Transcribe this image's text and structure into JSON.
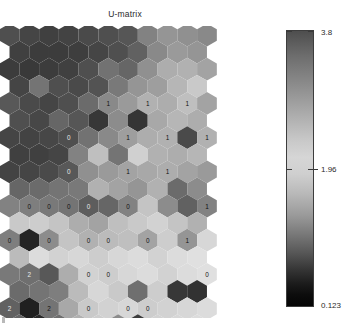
{
  "figure": {
    "title": "U-matrix",
    "background": "#ffffff"
  },
  "colorbar": {
    "name": "u-matrix-colorbar",
    "max_label": "3.8",
    "mid_label": "1.96",
    "min_label": "0.123",
    "max_value": 3.8,
    "mid_value": 1.96,
    "min_value": 0.123,
    "orientation": "vertical"
  },
  "chart_data": {
    "type": "heatmap",
    "subtype": "hexagonal-som-umatrix",
    "title": "U-matrix",
    "xlabel": "",
    "ylabel": "",
    "grid": false,
    "legend_position": "right",
    "colorbar": {
      "ticks": [
        0.123,
        1.96,
        3.8
      ],
      "tick_labels": [
        "0.123",
        "1.96",
        "3.8"
      ],
      "colormap": "gray-inverted",
      "vmin": 0.123,
      "vmax": 3.8
    },
    "layout": {
      "lattice": "hexagonal",
      "columns": 11,
      "rows": 17,
      "odd_row_offset": 0.5
    },
    "note": "Values are U-matrix distances mapped to gray levels; light = high separation, dark = low.",
    "cells": [
      {
        "row": 0,
        "col": 0,
        "v": 0.3,
        "label": ""
      },
      {
        "row": 0,
        "col": 1,
        "v": 0.26,
        "label": ""
      },
      {
        "row": 0,
        "col": 2,
        "v": 0.24,
        "label": ""
      },
      {
        "row": 0,
        "col": 3,
        "v": 0.25,
        "label": ""
      },
      {
        "row": 0,
        "col": 4,
        "v": 0.28,
        "label": ""
      },
      {
        "row": 0,
        "col": 5,
        "v": 0.3,
        "label": ""
      },
      {
        "row": 0,
        "col": 6,
        "v": 0.33,
        "label": ""
      },
      {
        "row": 0,
        "col": 7,
        "v": 0.52,
        "label": ""
      },
      {
        "row": 0,
        "col": 8,
        "v": 0.6,
        "label": ""
      },
      {
        "row": 0,
        "col": 9,
        "v": 0.58,
        "label": ""
      },
      {
        "row": 0,
        "col": 10,
        "v": 0.55,
        "label": ""
      },
      {
        "row": 1,
        "col": 0,
        "v": 0.24,
        "label": ""
      },
      {
        "row": 1,
        "col": 1,
        "v": 0.22,
        "label": ""
      },
      {
        "row": 1,
        "col": 2,
        "v": 0.22,
        "label": ""
      },
      {
        "row": 1,
        "col": 3,
        "v": 0.23,
        "label": ""
      },
      {
        "row": 1,
        "col": 4,
        "v": 0.26,
        "label": ""
      },
      {
        "row": 1,
        "col": 5,
        "v": 0.3,
        "label": ""
      },
      {
        "row": 1,
        "col": 6,
        "v": 0.38,
        "label": ""
      },
      {
        "row": 1,
        "col": 7,
        "v": 0.55,
        "label": ""
      },
      {
        "row": 1,
        "col": 8,
        "v": 0.62,
        "label": ""
      },
      {
        "row": 1,
        "col": 9,
        "v": 0.6,
        "label": ""
      },
      {
        "row": 2,
        "col": 0,
        "v": 0.22,
        "label": ""
      },
      {
        "row": 2,
        "col": 1,
        "v": 0.21,
        "label": ""
      },
      {
        "row": 2,
        "col": 2,
        "v": 0.22,
        "label": ""
      },
      {
        "row": 2,
        "col": 3,
        "v": 0.24,
        "label": ""
      },
      {
        "row": 2,
        "col": 4,
        "v": 0.3,
        "label": ""
      },
      {
        "row": 2,
        "col": 5,
        "v": 0.45,
        "label": ""
      },
      {
        "row": 2,
        "col": 6,
        "v": 0.4,
        "label": ""
      },
      {
        "row": 2,
        "col": 7,
        "v": 0.58,
        "label": ""
      },
      {
        "row": 2,
        "col": 8,
        "v": 0.7,
        "label": ""
      },
      {
        "row": 2,
        "col": 9,
        "v": 0.72,
        "label": ""
      },
      {
        "row": 2,
        "col": 10,
        "v": 0.66,
        "label": ""
      },
      {
        "row": 3,
        "col": 0,
        "v": 0.26,
        "label": ""
      },
      {
        "row": 3,
        "col": 1,
        "v": 0.46,
        "label": ""
      },
      {
        "row": 3,
        "col": 2,
        "v": 0.3,
        "label": ""
      },
      {
        "row": 3,
        "col": 3,
        "v": 0.28,
        "label": ""
      },
      {
        "row": 3,
        "col": 4,
        "v": 0.32,
        "label": ""
      },
      {
        "row": 3,
        "col": 5,
        "v": 0.48,
        "label": ""
      },
      {
        "row": 3,
        "col": 6,
        "v": 0.6,
        "label": ""
      },
      {
        "row": 3,
        "col": 7,
        "v": 0.64,
        "label": ""
      },
      {
        "row": 3,
        "col": 8,
        "v": 0.74,
        "label": ""
      },
      {
        "row": 3,
        "col": 9,
        "v": 0.82,
        "label": ""
      },
      {
        "row": 4,
        "col": 0,
        "v": 0.34,
        "label": ""
      },
      {
        "row": 4,
        "col": 1,
        "v": 0.28,
        "label": ""
      },
      {
        "row": 4,
        "col": 2,
        "v": 0.26,
        "label": ""
      },
      {
        "row": 4,
        "col": 3,
        "v": 0.3,
        "label": ""
      },
      {
        "row": 4,
        "col": 4,
        "v": 0.42,
        "label": ""
      },
      {
        "row": 4,
        "col": 5,
        "v": 0.55,
        "label": "1"
      },
      {
        "row": 4,
        "col": 6,
        "v": 0.62,
        "label": ""
      },
      {
        "row": 4,
        "col": 7,
        "v": 0.72,
        "label": "1"
      },
      {
        "row": 4,
        "col": 8,
        "v": 0.7,
        "label": ""
      },
      {
        "row": 4,
        "col": 9,
        "v": 0.78,
        "label": "1"
      },
      {
        "row": 4,
        "col": 10,
        "v": 0.66,
        "label": ""
      },
      {
        "row": 5,
        "col": 0,
        "v": 0.3,
        "label": ""
      },
      {
        "row": 5,
        "col": 1,
        "v": 0.27,
        "label": ""
      },
      {
        "row": 5,
        "col": 2,
        "v": 0.4,
        "label": ""
      },
      {
        "row": 5,
        "col": 3,
        "v": 0.33,
        "label": ""
      },
      {
        "row": 5,
        "col": 4,
        "v": 0.2,
        "label": ""
      },
      {
        "row": 5,
        "col": 5,
        "v": 0.56,
        "label": ""
      },
      {
        "row": 5,
        "col": 6,
        "v": 0.19,
        "label": ""
      },
      {
        "row": 5,
        "col": 7,
        "v": 0.68,
        "label": ""
      },
      {
        "row": 5,
        "col": 8,
        "v": 0.74,
        "label": ""
      },
      {
        "row": 5,
        "col": 9,
        "v": 0.7,
        "label": ""
      },
      {
        "row": 6,
        "col": 0,
        "v": 0.26,
        "label": ""
      },
      {
        "row": 6,
        "col": 1,
        "v": 0.25,
        "label": ""
      },
      {
        "row": 6,
        "col": 2,
        "v": 0.27,
        "label": ""
      },
      {
        "row": 6,
        "col": 3,
        "v": 0.3,
        "label": "0"
      },
      {
        "row": 6,
        "col": 4,
        "v": 0.45,
        "label": ""
      },
      {
        "row": 6,
        "col": 5,
        "v": 0.55,
        "label": ""
      },
      {
        "row": 6,
        "col": 6,
        "v": 0.64,
        "label": "1"
      },
      {
        "row": 6,
        "col": 7,
        "v": 0.7,
        "label": ""
      },
      {
        "row": 6,
        "col": 8,
        "v": 0.72,
        "label": "1"
      },
      {
        "row": 6,
        "col": 9,
        "v": 0.28,
        "label": ""
      },
      {
        "row": 6,
        "col": 10,
        "v": 0.72,
        "label": "1"
      },
      {
        "row": 7,
        "col": 0,
        "v": 0.24,
        "label": ""
      },
      {
        "row": 7,
        "col": 1,
        "v": 0.24,
        "label": ""
      },
      {
        "row": 7,
        "col": 2,
        "v": 0.26,
        "label": ""
      },
      {
        "row": 7,
        "col": 3,
        "v": 0.52,
        "label": ""
      },
      {
        "row": 7,
        "col": 4,
        "v": 0.78,
        "label": ""
      },
      {
        "row": 7,
        "col": 5,
        "v": 0.46,
        "label": ""
      },
      {
        "row": 7,
        "col": 6,
        "v": 0.85,
        "label": ""
      },
      {
        "row": 7,
        "col": 7,
        "v": 0.72,
        "label": ""
      },
      {
        "row": 7,
        "col": 8,
        "v": 0.7,
        "label": ""
      },
      {
        "row": 7,
        "col": 9,
        "v": 0.74,
        "label": ""
      },
      {
        "row": 8,
        "col": 0,
        "v": 0.25,
        "label": ""
      },
      {
        "row": 8,
        "col": 1,
        "v": 0.26,
        "label": ""
      },
      {
        "row": 8,
        "col": 2,
        "v": 0.28,
        "label": ""
      },
      {
        "row": 8,
        "col": 3,
        "v": 0.34,
        "label": "0"
      },
      {
        "row": 8,
        "col": 4,
        "v": 0.58,
        "label": ""
      },
      {
        "row": 8,
        "col": 5,
        "v": 0.62,
        "label": ""
      },
      {
        "row": 8,
        "col": 6,
        "v": 0.66,
        "label": "1"
      },
      {
        "row": 8,
        "col": 7,
        "v": 0.68,
        "label": ""
      },
      {
        "row": 8,
        "col": 8,
        "v": 0.7,
        "label": "1"
      },
      {
        "row": 8,
        "col": 9,
        "v": 0.66,
        "label": ""
      },
      {
        "row": 8,
        "col": 10,
        "v": 0.62,
        "label": ""
      },
      {
        "row": 9,
        "col": 0,
        "v": 0.4,
        "label": ""
      },
      {
        "row": 9,
        "col": 1,
        "v": 0.42,
        "label": ""
      },
      {
        "row": 9,
        "col": 2,
        "v": 0.46,
        "label": ""
      },
      {
        "row": 9,
        "col": 3,
        "v": 0.48,
        "label": ""
      },
      {
        "row": 9,
        "col": 4,
        "v": 0.72,
        "label": ""
      },
      {
        "row": 9,
        "col": 5,
        "v": 0.66,
        "label": ""
      },
      {
        "row": 9,
        "col": 6,
        "v": 0.6,
        "label": ""
      },
      {
        "row": 9,
        "col": 7,
        "v": 0.72,
        "label": ""
      },
      {
        "row": 9,
        "col": 8,
        "v": 0.42,
        "label": ""
      },
      {
        "row": 9,
        "col": 9,
        "v": 0.56,
        "label": ""
      },
      {
        "row": 10,
        "col": 0,
        "v": 0.52,
        "label": ""
      },
      {
        "row": 10,
        "col": 1,
        "v": 0.5,
        "label": "0"
      },
      {
        "row": 10,
        "col": 2,
        "v": 0.48,
        "label": "0"
      },
      {
        "row": 10,
        "col": 3,
        "v": 0.46,
        "label": "0"
      },
      {
        "row": 10,
        "col": 4,
        "v": 0.36,
        "label": "0"
      },
      {
        "row": 10,
        "col": 5,
        "v": 0.4,
        "label": ""
      },
      {
        "row": 10,
        "col": 6,
        "v": 0.52,
        "label": "0"
      },
      {
        "row": 10,
        "col": 7,
        "v": 0.8,
        "label": ""
      },
      {
        "row": 10,
        "col": 8,
        "v": 0.56,
        "label": ""
      },
      {
        "row": 10,
        "col": 9,
        "v": 0.38,
        "label": ""
      },
      {
        "row": 10,
        "col": 10,
        "v": 0.52,
        "label": "1"
      },
      {
        "row": 11,
        "col": 0,
        "v": 0.82,
        "label": ""
      },
      {
        "row": 11,
        "col": 1,
        "v": 0.84,
        "label": ""
      },
      {
        "row": 11,
        "col": 2,
        "v": 0.8,
        "label": ""
      },
      {
        "row": 11,
        "col": 3,
        "v": 0.7,
        "label": ""
      },
      {
        "row": 11,
        "col": 4,
        "v": 0.66,
        "label": ""
      },
      {
        "row": 11,
        "col": 5,
        "v": 0.78,
        "label": ""
      },
      {
        "row": 11,
        "col": 6,
        "v": 0.82,
        "label": ""
      },
      {
        "row": 11,
        "col": 7,
        "v": 0.86,
        "label": ""
      },
      {
        "row": 11,
        "col": 8,
        "v": 0.8,
        "label": ""
      },
      {
        "row": 11,
        "col": 9,
        "v": 0.72,
        "label": ""
      },
      {
        "row": 12,
        "col": 0,
        "v": 0.5,
        "label": "0"
      },
      {
        "row": 12,
        "col": 1,
        "v": 0.12,
        "label": ""
      },
      {
        "row": 12,
        "col": 2,
        "v": 0.56,
        "label": "0"
      },
      {
        "row": 12,
        "col": 3,
        "v": 0.8,
        "label": ""
      },
      {
        "row": 12,
        "col": 4,
        "v": 0.72,
        "label": "0"
      },
      {
        "row": 12,
        "col": 5,
        "v": 0.76,
        "label": "0"
      },
      {
        "row": 12,
        "col": 6,
        "v": 0.78,
        "label": ""
      },
      {
        "row": 12,
        "col": 7,
        "v": 0.66,
        "label": "0"
      },
      {
        "row": 12,
        "col": 8,
        "v": 0.84,
        "label": ""
      },
      {
        "row": 12,
        "col": 9,
        "v": 0.6,
        "label": "1"
      },
      {
        "row": 12,
        "col": 10,
        "v": 0.88,
        "label": ""
      },
      {
        "row": 13,
        "col": 0,
        "v": 0.76,
        "label": ""
      },
      {
        "row": 13,
        "col": 1,
        "v": 0.9,
        "label": ""
      },
      {
        "row": 13,
        "col": 2,
        "v": 0.86,
        "label": ""
      },
      {
        "row": 13,
        "col": 3,
        "v": 0.88,
        "label": ""
      },
      {
        "row": 13,
        "col": 4,
        "v": 0.84,
        "label": ""
      },
      {
        "row": 13,
        "col": 5,
        "v": 0.88,
        "label": ""
      },
      {
        "row": 13,
        "col": 6,
        "v": 0.9,
        "label": ""
      },
      {
        "row": 13,
        "col": 7,
        "v": 0.86,
        "label": ""
      },
      {
        "row": 13,
        "col": 8,
        "v": 0.9,
        "label": ""
      },
      {
        "row": 13,
        "col": 9,
        "v": 0.92,
        "label": ""
      },
      {
        "row": 14,
        "col": 0,
        "v": 0.48,
        "label": ""
      },
      {
        "row": 14,
        "col": 1,
        "v": 0.44,
        "label": "2"
      },
      {
        "row": 14,
        "col": 2,
        "v": 0.34,
        "label": ""
      },
      {
        "row": 14,
        "col": 3,
        "v": 0.7,
        "label": ""
      },
      {
        "row": 14,
        "col": 4,
        "v": 0.86,
        "label": "0"
      },
      {
        "row": 14,
        "col": 5,
        "v": 0.84,
        "label": "0"
      },
      {
        "row": 14,
        "col": 6,
        "v": 0.88,
        "label": ""
      },
      {
        "row": 14,
        "col": 7,
        "v": 0.9,
        "label": ""
      },
      {
        "row": 14,
        "col": 8,
        "v": 0.86,
        "label": ""
      },
      {
        "row": 14,
        "col": 9,
        "v": 0.9,
        "label": ""
      },
      {
        "row": 14,
        "col": 10,
        "v": 0.92,
        "label": "0"
      },
      {
        "row": 15,
        "col": 0,
        "v": 0.42,
        "label": ""
      },
      {
        "row": 15,
        "col": 1,
        "v": 0.46,
        "label": ""
      },
      {
        "row": 15,
        "col": 2,
        "v": 0.5,
        "label": ""
      },
      {
        "row": 15,
        "col": 3,
        "v": 0.76,
        "label": ""
      },
      {
        "row": 15,
        "col": 4,
        "v": 0.88,
        "label": ""
      },
      {
        "row": 15,
        "col": 5,
        "v": 0.82,
        "label": ""
      },
      {
        "row": 15,
        "col": 6,
        "v": 0.44,
        "label": ""
      },
      {
        "row": 15,
        "col": 7,
        "v": 0.84,
        "label": ""
      },
      {
        "row": 15,
        "col": 8,
        "v": 0.2,
        "label": ""
      },
      {
        "row": 15,
        "col": 9,
        "v": 0.18,
        "label": ""
      },
      {
        "row": 16,
        "col": 0,
        "v": 0.38,
        "label": "2"
      },
      {
        "row": 16,
        "col": 1,
        "v": 0.1,
        "label": ""
      },
      {
        "row": 16,
        "col": 2,
        "v": 0.46,
        "label": "2"
      },
      {
        "row": 16,
        "col": 3,
        "v": 0.68,
        "label": ""
      },
      {
        "row": 16,
        "col": 4,
        "v": 0.82,
        "label": "0"
      },
      {
        "row": 16,
        "col": 5,
        "v": 0.86,
        "label": ""
      },
      {
        "row": 16,
        "col": 6,
        "v": 0.88,
        "label": "0"
      },
      {
        "row": 16,
        "col": 7,
        "v": 0.84,
        "label": "0"
      },
      {
        "row": 16,
        "col": 8,
        "v": 0.86,
        "label": ""
      },
      {
        "row": 16,
        "col": 9,
        "v": 0.88,
        "label": ""
      },
      {
        "row": 16,
        "col": 10,
        "v": 0.9,
        "label": ""
      },
      {
        "row": 17,
        "col": 0,
        "v": 0.4,
        "label": ""
      },
      {
        "row": 17,
        "col": 1,
        "v": 0.14,
        "label": ""
      },
      {
        "row": 17,
        "col": 2,
        "v": 0.44,
        "label": ""
      },
      {
        "row": 17,
        "col": 3,
        "v": 0.72,
        "label": ""
      },
      {
        "row": 17,
        "col": 4,
        "v": 0.84,
        "label": ""
      },
      {
        "row": 17,
        "col": 5,
        "v": 0.56,
        "label": ""
      },
      {
        "row": 17,
        "col": 6,
        "v": 0.22,
        "label": ""
      },
      {
        "row": 17,
        "col": 7,
        "v": 0.86,
        "label": ""
      },
      {
        "row": 17,
        "col": 8,
        "v": 0.88,
        "label": ""
      },
      {
        "row": 17,
        "col": 9,
        "v": 0.9,
        "label": ""
      },
      {
        "row": 18,
        "col": 0,
        "v": 0.42,
        "label": "2"
      },
      {
        "row": 18,
        "col": 1,
        "v": 0.36,
        "label": ""
      },
      {
        "row": 18,
        "col": 2,
        "v": 0.48,
        "label": "2"
      },
      {
        "row": 18,
        "col": 3,
        "v": 0.74,
        "label": ""
      },
      {
        "row": 18,
        "col": 4,
        "v": 0.8,
        "label": ""
      },
      {
        "row": 18,
        "col": 5,
        "v": 0.84,
        "label": "0"
      },
      {
        "row": 18,
        "col": 6,
        "v": 0.86,
        "label": ""
      },
      {
        "row": 18,
        "col": 7,
        "v": 0.88,
        "label": "0"
      },
      {
        "row": 18,
        "col": 8,
        "v": 0.82,
        "label": ""
      },
      {
        "row": 18,
        "col": 9,
        "v": 0.86,
        "label": "0"
      },
      {
        "row": 18,
        "col": 10,
        "v": 0.9,
        "label": "0"
      }
    ]
  }
}
